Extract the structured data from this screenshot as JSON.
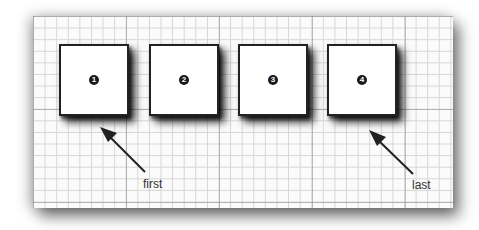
{
  "diagram": {
    "boxes": [
      {
        "number": "1",
        "x": 59,
        "y": 44
      },
      {
        "number": "2",
        "x": 149,
        "y": 44
      },
      {
        "number": "3",
        "x": 238,
        "y": 44
      },
      {
        "number": "4",
        "x": 327,
        "y": 44
      }
    ],
    "labels": {
      "first": "first",
      "last": "last"
    }
  }
}
